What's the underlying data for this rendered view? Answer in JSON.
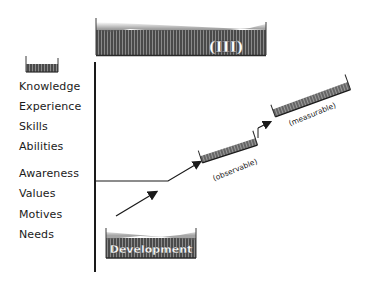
{
  "diagram": {
    "top_band": {
      "label": "(III)"
    },
    "bottom_block": {
      "label": "Development"
    },
    "levels": [
      {
        "label": "Knowledge",
        "y": 86
      },
      {
        "label": "Experience",
        "y": 106
      },
      {
        "label": "Skills",
        "y": 126
      },
      {
        "label": "Abilities",
        "y": 146
      },
      {
        "label": "Awareness",
        "y": 166
      },
      {
        "label": "Values",
        "y": 186
      },
      {
        "label": "Motives",
        "y": 206
      },
      {
        "label": "Needs",
        "y": 226
      }
    ],
    "steps": [
      {
        "label": "(observable)"
      },
      {
        "label": "(measurable)"
      }
    ],
    "colors": {
      "ink": "#1a1a1a",
      "band_dark": "#3a3a3a",
      "band_mid": "#6a6a6a"
    }
  }
}
